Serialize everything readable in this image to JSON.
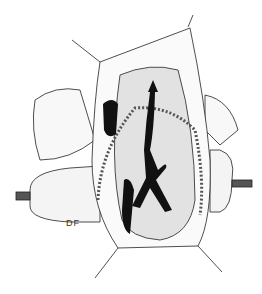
{
  "illustration": {
    "subject": "surgical-illustration",
    "signature": "DF",
    "colors": {
      "ink": "#111111",
      "paper": "#ffffff"
    }
  }
}
